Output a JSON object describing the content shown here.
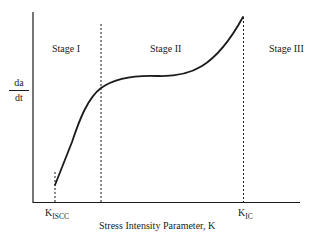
{
  "diagram": {
    "title": "",
    "y_axis_label": {
      "numerator": "da",
      "denominator": "dt"
    },
    "x_axis_label": "Stress Intensity Parameter, K",
    "stages": [
      {
        "label": "Stage I"
      },
      {
        "label": "Stage II"
      },
      {
        "label": "Stage III"
      }
    ],
    "markers": [
      {
        "main": "K",
        "sub": "ISCC"
      },
      {
        "main": "K",
        "sub": "IC"
      }
    ],
    "colors": {
      "line": "#1a1a1a",
      "background": "#ffffff"
    }
  }
}
